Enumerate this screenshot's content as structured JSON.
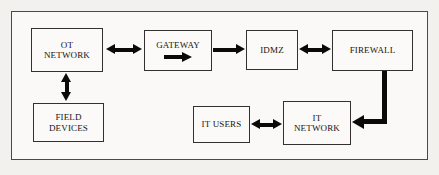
{
  "diagram": {
    "background_color": "#f2f1ee",
    "frame_color": "#4a4a4a",
    "box_border_color": "#33312f",
    "box_fill_color": "#fbfaf8",
    "arrow_color": "#0a0a0a",
    "nodes": [
      {
        "id": "ot-network",
        "label": "OT\nNETWORK"
      },
      {
        "id": "gateway",
        "label": "GATEWAY"
      },
      {
        "id": "idmz",
        "label": "IDMZ"
      },
      {
        "id": "firewall",
        "label": "FIREWALL"
      },
      {
        "id": "field-devices",
        "label": "FIELD\nDEVICES"
      },
      {
        "id": "it-users",
        "label": "IT USERS"
      },
      {
        "id": "it-network",
        "label": "IT\nNETWORK"
      }
    ],
    "connectors": [
      {
        "id": "ot-gateway",
        "from": "ot-network",
        "to": "gateway",
        "style": "double-arrow",
        "orientation": "horizontal"
      },
      {
        "id": "gateway-idmz",
        "from": "gateway",
        "to": "idmz",
        "style": "single-arrow",
        "orientation": "horizontal"
      },
      {
        "id": "idmz-firewall",
        "from": "idmz",
        "to": "firewall",
        "style": "double-arrow",
        "orientation": "horizontal"
      },
      {
        "id": "ot-field-devices",
        "from": "ot-network",
        "to": "field-devices",
        "style": "double-arrow",
        "orientation": "vertical"
      },
      {
        "id": "itusers-itnetwork",
        "from": "it-users",
        "to": "it-network",
        "style": "double-arrow",
        "orientation": "horizontal"
      },
      {
        "id": "firewall-itnetwork",
        "from": "firewall",
        "to": "it-network",
        "style": "single-arrow",
        "orientation": "elbow-down-left"
      }
    ],
    "gateway_inner_icon": "right-arrow-icon"
  }
}
